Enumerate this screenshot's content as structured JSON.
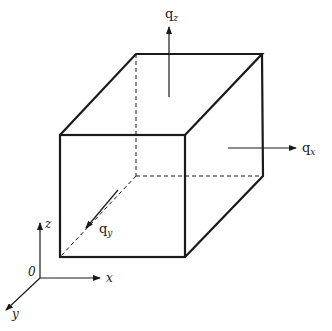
{
  "diagram": {
    "type": "control-volume-cube",
    "colors": {
      "line": "#1a1a1a",
      "background": "#ffffff"
    },
    "flux_labels": {
      "qz": {
        "base": "q",
        "sub": "z"
      },
      "qx": {
        "base": "q",
        "sub": "x"
      },
      "qy": {
        "base": "q",
        "sub": "y"
      }
    },
    "axes": {
      "origin": "0",
      "x": "x",
      "y": "y",
      "z": "z"
    }
  }
}
